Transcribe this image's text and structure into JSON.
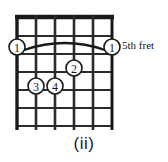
{
  "figure": {
    "kind": "guitar-chord-diagram",
    "caption": "(ii)",
    "position_label": "5th fret",
    "colors": {
      "ink": "#1a1a1a",
      "background": "#ffffff",
      "grid": "#2b2b2b"
    },
    "fretboard": {
      "strings": 6,
      "frets": 6,
      "nut_thick": true,
      "string_x": [
        17,
        36,
        55,
        74,
        93,
        112
      ],
      "fret_y": [
        17,
        36,
        54,
        72,
        90,
        108,
        126
      ],
      "left": 17,
      "right": 112,
      "top": 17,
      "bottom": 126
    },
    "barre": {
      "label": "1",
      "from_string": 1,
      "to_string": 6,
      "fret": 1,
      "arc_apex_y": 40,
      "arc_end_y": 50
    },
    "finger_markers": [
      {
        "label": "1",
        "string": 1,
        "fret": 1,
        "cx": 17,
        "cy": 47,
        "r": 8
      },
      {
        "label": "1",
        "string": 6,
        "fret": 1,
        "cx": 112,
        "cy": 47,
        "r": 8
      },
      {
        "label": "2",
        "string": 4,
        "fret": 2,
        "cx": 74,
        "cy": 68,
        "r": 8
      },
      {
        "label": "3",
        "string": 2,
        "fret": 3,
        "cx": 36,
        "cy": 86,
        "r": 8
      },
      {
        "label": "4",
        "string": 3,
        "fret": 3,
        "cx": 55,
        "cy": 86,
        "r": 8
      }
    ]
  }
}
